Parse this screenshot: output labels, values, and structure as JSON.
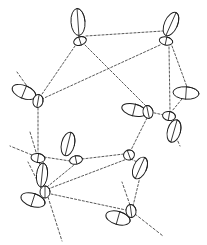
{
  "figure": {
    "kind": "crystal-structure-diagram",
    "width": 207,
    "height": 245,
    "background_color": "#ffffff",
    "ellipsoid_outline_color": "#1c1c1c",
    "bond_color": "#3a3a3a",
    "bond_style": "dashed"
  },
  "chart_data": {
    "type": "scatter",
    "title": "",
    "xlabel": "",
    "ylabel": "",
    "xlim": [
      0,
      207
    ],
    "ylim": [
      0,
      245
    ],
    "grid": false,
    "legend": "none",
    "atoms": [
      {
        "id": "A1",
        "cx": 78,
        "cy": 22,
        "rx": 7.0,
        "ry": 13.5,
        "angle": -4
      },
      {
        "id": "A2",
        "cx": 80,
        "cy": 41,
        "rx": 6.5,
        "ry": 4.2,
        "angle": -18
      },
      {
        "id": "A3",
        "cx": 171,
        "cy": 24,
        "rx": 6.5,
        "ry": 12.5,
        "angle": 24
      },
      {
        "id": "A4",
        "cx": 166,
        "cy": 41,
        "rx": 6.8,
        "ry": 4.0,
        "angle": 12
      },
      {
        "id": "A5",
        "cx": 24,
        "cy": 92,
        "rx": 12.5,
        "ry": 6.5,
        "angle": 22
      },
      {
        "id": "A6",
        "cx": 38,
        "cy": 101,
        "rx": 5.0,
        "ry": 6.5,
        "angle": 10
      },
      {
        "id": "A7",
        "cx": 186,
        "cy": 93,
        "rx": 13.0,
        "ry": 6.2,
        "angle": 4
      },
      {
        "id": "A8",
        "cx": 134,
        "cy": 110,
        "rx": 12.5,
        "ry": 6.0,
        "angle": 14
      },
      {
        "id": "A9",
        "cx": 148,
        "cy": 112,
        "rx": 5.0,
        "ry": 6.5,
        "angle": -12
      },
      {
        "id": "A10",
        "cx": 169,
        "cy": 116,
        "rx": 6.5,
        "ry": 4.5,
        "angle": 10
      },
      {
        "id": "A11",
        "cx": 174,
        "cy": 131,
        "rx": 6.5,
        "ry": 11.5,
        "angle": 16
      },
      {
        "id": "A12",
        "cx": 68,
        "cy": 144,
        "rx": 6.5,
        "ry": 12.0,
        "angle": 14
      },
      {
        "id": "A13",
        "cx": 76,
        "cy": 160,
        "rx": 6.5,
        "ry": 4.2,
        "angle": -12
      },
      {
        "id": "A14",
        "cx": 38,
        "cy": 158,
        "rx": 7.0,
        "ry": 4.5,
        "angle": 8
      },
      {
        "id": "A15",
        "cx": 42,
        "cy": 175,
        "rx": 5.5,
        "ry": 12.0,
        "angle": 6
      },
      {
        "id": "A16",
        "cx": 129,
        "cy": 155,
        "rx": 5.5,
        "ry": 5.0,
        "angle": -20
      },
      {
        "id": "A17",
        "cx": 140,
        "cy": 168,
        "rx": 6.5,
        "ry": 11.5,
        "angle": 24
      },
      {
        "id": "A18",
        "cx": 33,
        "cy": 200,
        "rx": 12.5,
        "ry": 6.5,
        "angle": 18
      },
      {
        "id": "A19",
        "cx": 45,
        "cy": 192,
        "rx": 5.0,
        "ry": 6.0,
        "angle": 0
      },
      {
        "id": "A20",
        "cx": 118,
        "cy": 218,
        "rx": 12.5,
        "ry": 6.5,
        "angle": 16
      },
      {
        "id": "A21",
        "cx": 131,
        "cy": 211,
        "rx": 5.0,
        "ry": 6.5,
        "angle": -8
      }
    ],
    "bonds": [
      {
        "from": "A2",
        "to": "A4",
        "x1": 86,
        "y1": 36,
        "x2": 163,
        "y2": 31
      },
      {
        "from": "A2",
        "to": "A6",
        "x1": 75,
        "y1": 46,
        "x2": 40,
        "y2": 97
      },
      {
        "from": "A2",
        "to": "A9",
        "x1": 85,
        "y1": 45,
        "x2": 146,
        "y2": 106
      },
      {
        "from": "A4",
        "to": "A6",
        "x1": 160,
        "y1": 45,
        "x2": 42,
        "y2": 99
      },
      {
        "from": "A4",
        "to": "A10",
        "x1": 169,
        "y1": 47,
        "x2": 170,
        "y2": 111
      },
      {
        "from": "A4",
        "to": "A7",
        "x1": 172,
        "y1": 46,
        "x2": 187,
        "y2": 87
      },
      {
        "from": "A6",
        "to": "A14",
        "x1": 38,
        "y1": 108,
        "x2": 38,
        "y2": 152
      },
      {
        "from": "A7",
        "to": "A10",
        "x1": 182,
        "y1": 99,
        "x2": 172,
        "y2": 111
      },
      {
        "from": "A8",
        "to": "A9",
        "x1": 141,
        "y1": 109,
        "x2": 146,
        "y2": 110
      },
      {
        "from": "A9",
        "to": "A10",
        "x1": 150,
        "y1": 112,
        "x2": 164,
        "y2": 115
      },
      {
        "from": "A9",
        "to": "A16",
        "x1": 147,
        "y1": 118,
        "x2": 131,
        "y2": 150
      },
      {
        "from": "A10",
        "to": "A11",
        "x1": 171,
        "y1": 120,
        "x2": 174,
        "y2": 124
      },
      {
        "from": "A13",
        "to": "A14",
        "x1": 70,
        "y1": 161,
        "x2": 44,
        "y2": 157
      },
      {
        "from": "A13",
        "to": "A16",
        "x1": 82,
        "y1": 159,
        "x2": 124,
        "y2": 154
      },
      {
        "from": "A14",
        "to": "A15",
        "x1": 39,
        "y1": 163,
        "x2": 42,
        "y2": 167
      },
      {
        "from": "A14",
        "to": "A19",
        "x1": 40,
        "y1": 163,
        "x2": 45,
        "y2": 187
      },
      {
        "from": "A16",
        "to": "A17",
        "x1": 131,
        "y1": 159,
        "x2": 137,
        "y2": 162
      },
      {
        "from": "A19",
        "to": "A21",
        "x1": 51,
        "y1": 194,
        "x2": 126,
        "y2": 210
      },
      {
        "from": "A19",
        "to": "A13",
        "x1": 47,
        "y1": 187,
        "x2": 74,
        "y2": 165
      },
      {
        "from": "A21",
        "to": "A17",
        "x1": 133,
        "y1": 206,
        "x2": 140,
        "y2": 177
      },
      {
        "from": "A19",
        "to": "A16",
        "x1": 48,
        "y1": 189,
        "x2": 127,
        "y2": 159
      }
    ],
    "open_bonds": [
      {
        "from": "A6",
        "x1": 34,
        "y1": 96,
        "x2": 17,
        "y2": 72
      },
      {
        "from": "A14",
        "x1": 32,
        "y1": 155,
        "x2": 10,
        "y2": 146
      },
      {
        "from": "A14",
        "x1": 36,
        "y1": 152,
        "x2": 30,
        "y2": 132
      },
      {
        "from": "A19",
        "x1": 41,
        "y1": 188,
        "x2": 28,
        "y2": 162
      },
      {
        "from": "A19",
        "x1": 48,
        "y1": 197,
        "x2": 62,
        "y2": 241
      },
      {
        "from": "A21",
        "x1": 130,
        "y1": 205,
        "x2": 122,
        "y2": 182
      },
      {
        "from": "A21",
        "x1": 135,
        "y1": 214,
        "x2": 163,
        "y2": 236
      },
      {
        "from": "A11",
        "x1": 176,
        "y1": 137,
        "x2": 180,
        "y2": 146
      }
    ]
  }
}
